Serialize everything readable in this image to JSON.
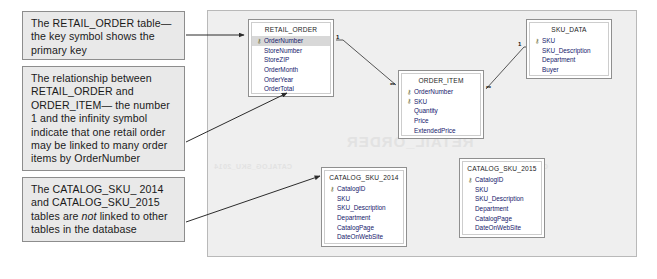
{
  "callouts": [
    {
      "id": "primary-key",
      "text": "The RETAIL_ORDER table—the key symbol shows the primary key"
    },
    {
      "id": "relationship",
      "text": "The relationship between RETAIL_ORDER and ORDER_ITEM— the number 1 and the infinity symbol indicate that one retail order may be linked to many order items by OrderNumber"
    },
    {
      "id": "catalog-tables",
      "text_before": "The CATALOG_SKU_ 2014 and CATALOG_SKU_2015 tables are ",
      "text_italic": "not",
      "text_after": " linked to other tables in the database"
    }
  ],
  "panel": {
    "ghost_retail_order": "RETAIL_ORDER",
    "ghost_catalog_2015": "CATALOG_SKU_2015",
    "ghost_catalog_2014": "CATALOG_SKU_2014"
  },
  "tables": {
    "retail_order": {
      "title": "RETAIL_ORDER",
      "fields": [
        {
          "name": "OrderNumber",
          "key": true
        },
        {
          "name": "StoreNumber",
          "key": false
        },
        {
          "name": "StoreZIP",
          "key": false
        },
        {
          "name": "OrderMonth",
          "key": false
        },
        {
          "name": "OrderYear",
          "key": false
        },
        {
          "name": "OrderTotal",
          "key": false
        }
      ]
    },
    "order_item": {
      "title": "ORDER_ITEM",
      "fields": [
        {
          "name": "OrderNumber",
          "key": true
        },
        {
          "name": "SKU",
          "key": true
        },
        {
          "name": "Quantity",
          "key": false
        },
        {
          "name": "Price",
          "key": false
        },
        {
          "name": "ExtendedPrice",
          "key": false
        }
      ]
    },
    "sku_data": {
      "title": "SKU_DATA",
      "fields": [
        {
          "name": "SKU",
          "key": true
        },
        {
          "name": "SKU_Description",
          "key": false
        },
        {
          "name": "Department",
          "key": false
        },
        {
          "name": "Buyer",
          "key": false
        }
      ]
    },
    "catalog_sku_2014": {
      "title": "CATALOG_SKU_2014",
      "fields": [
        {
          "name": "CatalogID",
          "key": true
        },
        {
          "name": "SKU",
          "key": false
        },
        {
          "name": "SKU_Description",
          "key": false
        },
        {
          "name": "Department",
          "key": false
        },
        {
          "name": "CatalogPage",
          "key": false
        },
        {
          "name": "DateOnWebSite",
          "key": false
        }
      ]
    },
    "catalog_sku_2015": {
      "title": "CATALOG_SKU_2015",
      "fields": [
        {
          "name": "CatalogID",
          "key": true
        },
        {
          "name": "SKU",
          "key": false
        },
        {
          "name": "SKU_Description",
          "key": false
        },
        {
          "name": "Department",
          "key": false
        },
        {
          "name": "CatalogPage",
          "key": false
        },
        {
          "name": "DateOnWebSite",
          "key": false
        }
      ]
    }
  },
  "relationships": [
    {
      "id": "ro-oi",
      "from": "RETAIL_ORDER",
      "to": "ORDER_ITEM",
      "from_cardinality": "1",
      "to_cardinality": "∞"
    },
    {
      "id": "oi-sku",
      "from": "ORDER_ITEM",
      "to": "SKU_DATA",
      "from_cardinality": "∞",
      "to_cardinality": "1"
    }
  ],
  "icons": {
    "primary_key": "⚷"
  },
  "colors": {
    "callout_bg": "#e9e9e9",
    "callout_border": "#8d8d8d",
    "panel_bg": "#efefef",
    "table_bg": "#ffffff",
    "field_text": "#15186b",
    "key_row_bg": "#d8d8d8",
    "connector": "#555555"
  }
}
